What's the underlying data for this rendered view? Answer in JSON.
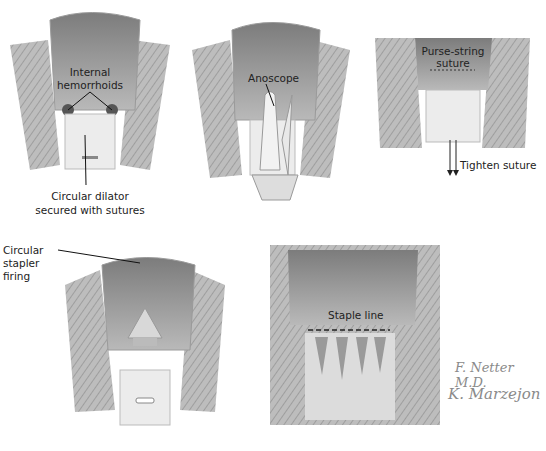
{
  "figure": {
    "panels": [
      {
        "id": "panel-1",
        "labels": [
          "Internal",
          "hemorrhoids",
          "Circular dilator",
          "secured with sutures"
        ]
      },
      {
        "id": "panel-2",
        "labels": [
          "Anoscope"
        ]
      },
      {
        "id": "panel-3",
        "labels": [
          "Purse-string",
          "suture",
          "Tighten suture"
        ]
      },
      {
        "id": "panel-4",
        "labels": [
          "Circular",
          "stapler",
          "firing"
        ]
      },
      {
        "id": "panel-5",
        "labels": [
          "Staple line"
        ]
      }
    ],
    "signatures": [
      "F. Netter M.D.",
      "K. Marzejon"
    ]
  },
  "colors": {
    "tissue": "#c9c9c9",
    "muscle": "#a8a8a8",
    "lumen": "#8e8e8e",
    "device": "#ececec",
    "text": "#222222"
  }
}
